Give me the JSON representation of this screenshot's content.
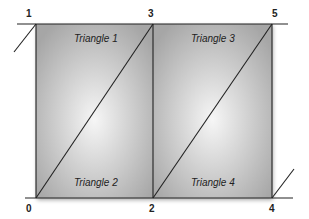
{
  "diagram": {
    "type": "triangle-strip",
    "vertices": [
      {
        "id": "0",
        "label": "0"
      },
      {
        "id": "1",
        "label": "1"
      },
      {
        "id": "2",
        "label": "2"
      },
      {
        "id": "3",
        "label": "3"
      },
      {
        "id": "4",
        "label": "4"
      },
      {
        "id": "5",
        "label": "5"
      }
    ],
    "triangles": [
      {
        "label": "Triangle 1"
      },
      {
        "label": "Triangle 2"
      },
      {
        "label": "Triangle 3"
      },
      {
        "label": "Triangle 4"
      }
    ],
    "colors": {
      "fill_dark": "#a8a8a8",
      "fill_light": "#f4f4f4",
      "stroke": "#222222",
      "background": "#ffffff"
    }
  }
}
